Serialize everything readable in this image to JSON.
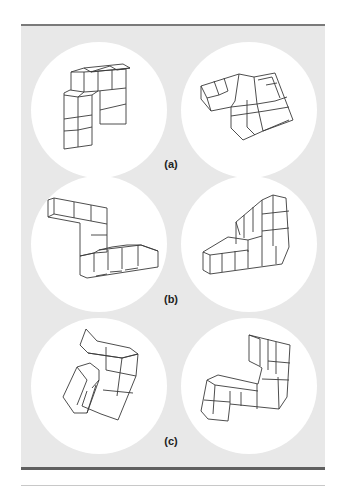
{
  "figure": {
    "rows": [
      {
        "label": "(a)",
        "pair": [
          "left-cube-figure",
          "right-cube-figure"
        ]
      },
      {
        "label": "(b)",
        "pair": [
          "left-cube-figure",
          "right-cube-figure"
        ]
      },
      {
        "label": "(c)",
        "pair": [
          "left-cube-figure",
          "right-cube-figure"
        ]
      }
    ],
    "colors": {
      "panel_background": "#e8e8e8",
      "circle_background": "#ffffff",
      "border": "#6a6a6a",
      "stroke": "#3a3a3a"
    }
  }
}
